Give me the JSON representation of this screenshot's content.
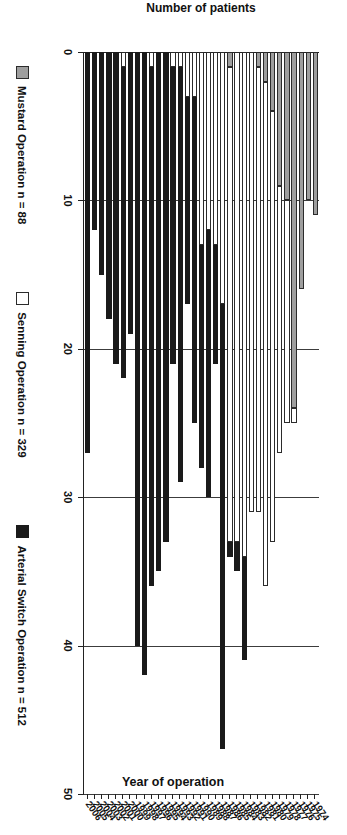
{
  "chart_data": {
    "type": "bar",
    "subtype": "stacked-horizontal-scan",
    "title": "",
    "xlabel": "Year of operation",
    "ylabel": "Number of patients",
    "ylim": [
      0,
      50
    ],
    "yticks": [
      0,
      10,
      20,
      30,
      40,
      50
    ],
    "grid": true,
    "legend_position": "bottom",
    "categories": [
      "1974",
      "1975",
      "1976",
      "1977",
      "1978",
      "1979",
      "1980",
      "1981",
      "1982",
      "1983",
      "1984",
      "1985",
      "1986",
      "1987",
      "1988",
      "1989",
      "1990",
      "1991",
      "1992",
      "1993",
      "1994",
      "1995",
      "1996",
      "1997",
      "1998",
      "1999",
      "2000",
      "2001",
      "2002",
      "2003",
      "2004",
      "2005",
      "2006"
    ],
    "series": [
      {
        "name": "Mustard Operation n = 88",
        "short_name": "Mustard",
        "color": "#9e9e9e",
        "total": 88,
        "values": [
          11,
          10,
          16,
          24,
          10,
          9,
          4,
          2,
          1,
          0,
          0,
          0,
          1,
          0,
          0,
          0,
          0,
          0,
          0,
          0,
          0,
          0,
          0,
          0,
          0,
          0,
          0,
          0,
          0,
          0,
          0,
          0,
          0
        ]
      },
      {
        "name": "Senning Operation n = 329",
        "short_name": "Senning",
        "color": "#ffffff",
        "total": 329,
        "values": [
          0,
          0,
          0,
          1,
          15,
          18,
          29,
          34,
          30,
          31,
          34,
          33,
          32,
          17,
          13,
          12,
          13,
          3,
          3,
          1,
          1,
          0,
          0,
          1,
          0,
          0,
          0,
          1,
          0,
          0,
          0,
          0,
          0
        ]
      },
      {
        "name": "Arterial Switch Operation n = 512",
        "short_name": "Arterial Switch",
        "color": "#1a1a1a",
        "total": 512,
        "values": [
          0,
          0,
          0,
          0,
          0,
          0,
          0,
          0,
          0,
          0,
          7,
          2,
          1,
          30,
          8,
          18,
          15,
          22,
          14,
          28,
          20,
          33,
          35,
          35,
          42,
          40,
          19,
          21,
          21,
          18,
          15,
          12,
          27
        ]
      }
    ],
    "totals": [
      11,
      10,
      16,
      25,
      25,
      27,
      33,
      36,
      31,
      31,
      41,
      35,
      34,
      47,
      21,
      30,
      28,
      25,
      17,
      29,
      21,
      33,
      35,
      36,
      42,
      40,
      19,
      22,
      21,
      18,
      15,
      12,
      27
    ]
  }
}
